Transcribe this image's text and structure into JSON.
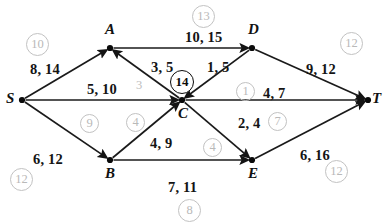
{
  "diagram": {
    "nodes": [
      {
        "id": "S",
        "label": "S",
        "x": 22,
        "y": 100,
        "label_dx": -16,
        "label_dy": -9
      },
      {
        "id": "A",
        "label": "A",
        "x": 110,
        "y": 48,
        "label_dx": -5,
        "label_dy": -26
      },
      {
        "id": "D",
        "label": "D",
        "x": 252,
        "y": 48,
        "label_dx": -4,
        "label_dy": -26
      },
      {
        "id": "C",
        "label": "C",
        "x": 182,
        "y": 100,
        "label_dx": -4,
        "label_dy": 6
      },
      {
        "id": "B",
        "label": "B",
        "x": 110,
        "y": 160,
        "label_dx": -5,
        "label_dy": 6
      },
      {
        "id": "E",
        "label": "E",
        "x": 252,
        "y": 160,
        "label_dx": -4,
        "label_dy": 6
      },
      {
        "id": "T",
        "label": "T",
        "x": 368,
        "y": 100,
        "label_dx": 4,
        "label_dy": -9
      }
    ],
    "edges": [
      {
        "from": "S",
        "to": "A",
        "flow": 8,
        "capacity": 14,
        "label": "8, 14",
        "label_x": 30,
        "label_y": 62
      },
      {
        "from": "S",
        "to": "C",
        "flow": 5,
        "capacity": 10,
        "label": "5, 10",
        "label_x": 87,
        "label_y": 82
      },
      {
        "from": "S",
        "to": "B",
        "flow": 6,
        "capacity": 12,
        "label": "6, 12",
        "label_x": 33,
        "label_y": 152
      },
      {
        "from": "A",
        "to": "D",
        "flow": 10,
        "capacity": 15,
        "label": "10, 15",
        "label_x": 185,
        "label_y": 30
      },
      {
        "from": "C",
        "to": "A",
        "flow": 3,
        "capacity": 5,
        "label": "3, 5",
        "label_x": 151,
        "label_y": 60
      },
      {
        "from": "D",
        "to": "C",
        "flow": 1,
        "capacity": 5,
        "label": "1, 5",
        "label_x": 207,
        "label_y": 60
      },
      {
        "from": "D",
        "to": "T",
        "flow": 9,
        "capacity": 12,
        "label": "9, 12",
        "label_x": 306,
        "label_y": 62
      },
      {
        "from": "C",
        "to": "T",
        "flow": 4,
        "capacity": 7,
        "label": "4, 7",
        "label_x": 263,
        "label_y": 86
      },
      {
        "from": "B",
        "to": "C",
        "flow": 4,
        "capacity": 9,
        "label": "4, 9",
        "label_x": 150,
        "label_y": 136
      },
      {
        "from": "C",
        "to": "E",
        "flow": 2,
        "capacity": 4,
        "label": "2, 4",
        "label_x": 238,
        "label_y": 116
      },
      {
        "from": "B",
        "to": "E",
        "flow": 7,
        "capacity": 11,
        "label": "7, 11",
        "label_x": 168,
        "label_y": 180
      },
      {
        "from": "E",
        "to": "T",
        "flow": 6,
        "capacity": 16,
        "label": "6, 16",
        "label_x": 300,
        "label_y": 148
      }
    ],
    "annotations": [
      {
        "value": "10",
        "x": 26,
        "y": 33,
        "size": "w2",
        "style": "gray"
      },
      {
        "value": "13",
        "x": 192,
        "y": 5,
        "size": "w2",
        "style": "gray"
      },
      {
        "value": "12",
        "x": 340,
        "y": 32,
        "size": "w2",
        "style": "gray"
      },
      {
        "value": "14",
        "x": 170,
        "y": 70,
        "size": "dark",
        "style": "dark"
      },
      {
        "value": "1",
        "x": 236,
        "y": 82,
        "size": "w1",
        "style": "gray"
      },
      {
        "value": "9",
        "x": 80,
        "y": 114,
        "size": "w1",
        "style": "gray"
      },
      {
        "value": "4",
        "x": 126,
        "y": 113,
        "size": "w1",
        "style": "gray"
      },
      {
        "value": "7",
        "x": 268,
        "y": 112,
        "size": "w1",
        "style": "gray"
      },
      {
        "value": "4",
        "x": 203,
        "y": 138,
        "size": "w1",
        "style": "gray"
      },
      {
        "value": "12",
        "x": 10,
        "y": 168,
        "size": "w2",
        "style": "gray"
      },
      {
        "value": "8",
        "x": 178,
        "y": 199,
        "size": "w2",
        "style": "gray"
      },
      {
        "value": "12",
        "x": 325,
        "y": 160,
        "size": "w2",
        "style": "gray"
      }
    ],
    "loose_digits": [
      {
        "value": "3",
        "x": 136,
        "y": 78
      }
    ],
    "colors": {
      "edge": "#1a1a1a",
      "node": "#0a0a0a",
      "annotation_gray": "#bdbdbd",
      "annotation_dark": "#0b0b0b",
      "background": "#ffffff"
    }
  }
}
